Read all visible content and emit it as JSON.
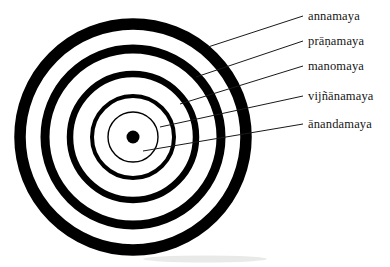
{
  "figure": {
    "center": {
      "x": 133,
      "y": 137
    },
    "center_dot_radius": 6.5,
    "ink_color": "#000000",
    "background_color": "#ffffff",
    "leader_color": "#1a1a1a"
  },
  "rings": [
    {
      "id": "ring-annamaya",
      "label": "annamaya",
      "radius": 113,
      "stroke_width": 11.5
    },
    {
      "id": "ring-pranamaya",
      "label": "prāṇamaya",
      "radius": 88,
      "stroke_width": 9.0
    },
    {
      "id": "ring-manomaya",
      "label": "manomaya",
      "radius": 63,
      "stroke_width": 6.5
    },
    {
      "id": "ring-vijnanamaya",
      "label": "vijñānamaya",
      "radius": 41,
      "stroke_width": 4.0
    },
    {
      "id": "ring-anandamaya",
      "label": "ānandamaya",
      "radius": 25,
      "stroke_width": 1.4
    }
  ],
  "labels": [
    {
      "id": "label-annamaya",
      "text": "annamaya",
      "x": 308,
      "y": 20,
      "leader_from": {
        "x": 208,
        "y": 47
      },
      "leader_to": {
        "x": 303,
        "y": 16
      }
    },
    {
      "id": "label-pranamaya",
      "text": "prāṇamaya",
      "x": 308,
      "y": 45,
      "leader_from": {
        "x": 196,
        "y": 77
      },
      "leader_to": {
        "x": 303,
        "y": 41
      }
    },
    {
      "id": "label-manomaya",
      "text": "manomaya",
      "x": 308,
      "y": 70,
      "leader_from": {
        "x": 180,
        "y": 104
      },
      "leader_to": {
        "x": 303,
        "y": 66
      }
    },
    {
      "id": "label-vijnanamaya",
      "text": "vijñānamaya",
      "x": 308,
      "y": 100,
      "leader_from": {
        "x": 160,
        "y": 127
      },
      "leader_to": {
        "x": 303,
        "y": 96
      }
    },
    {
      "id": "label-anandamaya",
      "text": "ānandamaya",
      "x": 308,
      "y": 128,
      "leader_from": {
        "x": 143,
        "y": 151
      },
      "leader_to": {
        "x": 303,
        "y": 124
      }
    }
  ]
}
